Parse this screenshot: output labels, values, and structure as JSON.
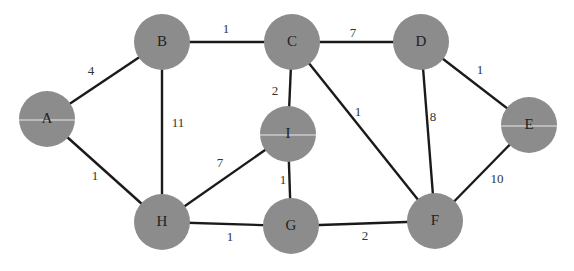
{
  "graph": {
    "type": "weighted-undirected-graph",
    "nodes": [
      {
        "id": "A",
        "label": "A",
        "x": 47,
        "y": 119
      },
      {
        "id": "B",
        "label": "B",
        "x": 162,
        "y": 42
      },
      {
        "id": "C",
        "label": "C",
        "x": 292,
        "y": 42
      },
      {
        "id": "D",
        "label": "D",
        "x": 421,
        "y": 42
      },
      {
        "id": "E",
        "label": "E",
        "x": 529,
        "y": 125
      },
      {
        "id": "F",
        "label": "F",
        "x": 435,
        "y": 221
      },
      {
        "id": "G",
        "label": "G",
        "x": 291,
        "y": 226
      },
      {
        "id": "H",
        "label": "H",
        "x": 162,
        "y": 222
      },
      {
        "id": "I",
        "label": "I",
        "x": 288,
        "y": 134
      }
    ],
    "edges": [
      {
        "from": "A",
        "to": "B",
        "weight": "4",
        "lx": 91,
        "ly": 72
      },
      {
        "from": "A",
        "to": "H",
        "weight": "1",
        "lx": 95,
        "ly": 177
      },
      {
        "from": "B",
        "to": "C",
        "weight": "1",
        "lx": 226,
        "ly": 30
      },
      {
        "from": "B",
        "to": "H",
        "weight": "11",
        "lx": 178,
        "ly": 124
      },
      {
        "from": "C",
        "to": "D",
        "weight": "7",
        "lx": 353,
        "ly": 34
      },
      {
        "from": "C",
        "to": "I",
        "weight": "2",
        "lx": 275,
        "ly": 92
      },
      {
        "from": "C",
        "to": "F",
        "weight": "1",
        "lx": 358,
        "ly": 113
      },
      {
        "from": "D",
        "to": "F",
        "weight": "8",
        "lx": 433,
        "ly": 118
      },
      {
        "from": "D",
        "to": "E",
        "weight": "1",
        "lx": 480,
        "ly": 71
      },
      {
        "from": "E",
        "to": "F",
        "weight": "10",
        "lx": 497,
        "ly": 180
      },
      {
        "from": "H",
        "to": "I",
        "weight": "7",
        "lx": 220,
        "ly": 164
      },
      {
        "from": "H",
        "to": "G",
        "weight": "1",
        "lx": 230,
        "ly": 238
      },
      {
        "from": "I",
        "to": "G",
        "weight": "1",
        "lx": 283,
        "ly": 181
      },
      {
        "from": "G",
        "to": "F",
        "weight": "2",
        "lx": 365,
        "ly": 237
      }
    ]
  },
  "colors": {
    "node_fill": "#8c8c8c",
    "edge": "#1a1a1a",
    "background": "#ffffff"
  }
}
